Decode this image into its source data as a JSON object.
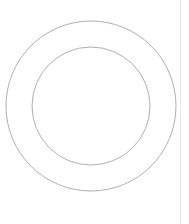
{
  "diagram": {
    "type": "concentric-circles",
    "center": {
      "x": 91,
      "y": 106
    },
    "circles": [
      {
        "name": "outer-circle",
        "r": 85,
        "stroke": "#9a9a9a",
        "stroke_width": 0.8
      },
      {
        "name": "inner-circle",
        "r": 59,
        "stroke": "#9a9a9a",
        "stroke_width": 0.8
      }
    ],
    "divider": {
      "x": 180,
      "color": "#e4e4e4"
    }
  }
}
